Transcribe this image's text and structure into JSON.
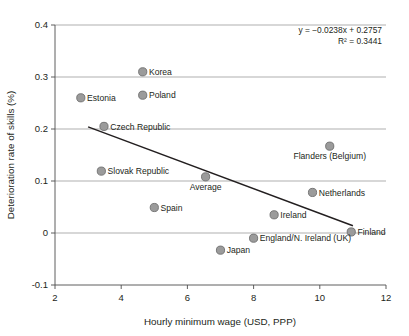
{
  "chart_data": {
    "type": "scatter",
    "title": "",
    "xlabel": "Hourly minimum wage (USD, PPP)",
    "ylabel": "Deterioration rate of skills (%)",
    "xlim": [
      2,
      12
    ],
    "ylim": [
      -0.1,
      0.4
    ],
    "xticks": [
      "2",
      "4",
      "6",
      "8",
      "10",
      "12"
    ],
    "xtick_values": [
      2,
      4,
      6,
      8,
      10,
      12
    ],
    "yticks": [
      "0.4",
      "0.3",
      "0.2",
      "0.1",
      "0",
      "-0.1"
    ],
    "ytick_values": [
      0.4,
      0.3,
      0.2,
      0.1,
      0,
      -0.1
    ],
    "grid": "horizontal",
    "legend": "none",
    "marker_color": "#9b9b9b",
    "marker_edge_color": "#6e6e6e",
    "trendline_color": "#231f20",
    "annotations": {
      "equation": "y = −0.0238x + 0.2757",
      "r_squared": "R² = 0.3441",
      "slope": -0.0238,
      "intercept": 0.2757,
      "r2": 0.3441
    },
    "trendline": {
      "x_start": 3.0,
      "y_start": 0.204,
      "x_end": 11.0,
      "y_end": 0.014
    },
    "points": [
      {
        "name": "Korea",
        "x": 4.65,
        "y": 0.31,
        "label_pos": "right"
      },
      {
        "name": "Estonia",
        "x": 2.78,
        "y": 0.26,
        "label_pos": "right"
      },
      {
        "name": "Poland",
        "x": 4.65,
        "y": 0.265,
        "label_pos": "right"
      },
      {
        "name": "Czech Republic",
        "x": 3.48,
        "y": 0.205,
        "label_pos": "right"
      },
      {
        "name": "Flanders (Belgium)",
        "x": 10.3,
        "y": 0.167,
        "label_pos": "below"
      },
      {
        "name": "Slovak Republic",
        "x": 3.4,
        "y": 0.119,
        "label_pos": "right"
      },
      {
        "name": "Average",
        "x": 6.55,
        "y": 0.108,
        "label_pos": "below"
      },
      {
        "name": "Netherlands",
        "x": 9.78,
        "y": 0.078,
        "label_pos": "right"
      },
      {
        "name": "Spain",
        "x": 5.0,
        "y": 0.049,
        "label_pos": "right"
      },
      {
        "name": "Ireland",
        "x": 8.62,
        "y": 0.035,
        "label_pos": "right"
      },
      {
        "name": "Finland",
        "x": 10.95,
        "y": 0.002,
        "label_pos": "right"
      },
      {
        "name": "England/N. Ireland (UK)",
        "x": 8.0,
        "y": -0.01,
        "label_pos": "right"
      },
      {
        "name": "Japan",
        "x": 7.0,
        "y": -0.033,
        "label_pos": "right"
      }
    ]
  }
}
